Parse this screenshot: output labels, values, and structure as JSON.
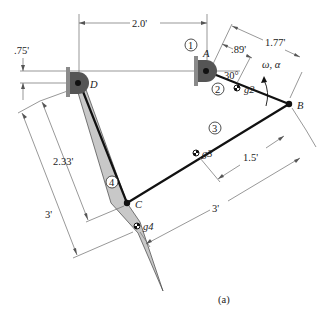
{
  "figure": {
    "caption": "(a)",
    "colors": {
      "background": "#ffffff",
      "link": "#111111",
      "plate_fill": "#c8c8c8",
      "ground": "#8a8a8a",
      "dimension_line": "#6b6b6b"
    }
  },
  "points": {
    "A": "A",
    "B": "B",
    "C": "C",
    "D": "D"
  },
  "centroids": {
    "g2": "g2",
    "g3": "g3",
    "g4": "g4"
  },
  "links": {
    "l1": "1",
    "l2": "2",
    "l3": "3",
    "l4": "4"
  },
  "angles": {
    "link2_angle": "30°"
  },
  "motion": {
    "label": "ω, α"
  },
  "dimensions": {
    "DA_horizontal": "2.0'",
    "vertical_offset": ".75'",
    "AB_length": "1.77'",
    "Ag2_length": ".89'",
    "Bg3_length": "1.5'",
    "BC_length": "3'",
    "Dg4_length": "2.33'",
    "DC_length": "3'"
  }
}
